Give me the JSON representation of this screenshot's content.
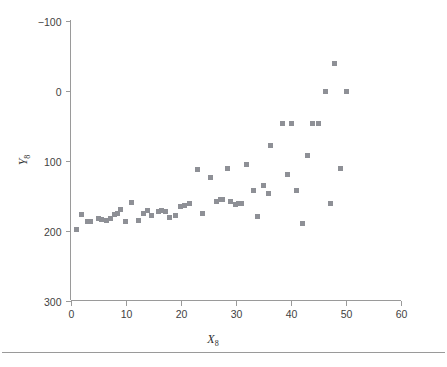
{
  "figure": {
    "background_color": "#ffffff",
    "axis_color": "#9a9a9a",
    "text_color": "#3f3f3f",
    "marker_color": "#8e9096",
    "footer_rule_color": "#9a9a9a"
  },
  "axes": {
    "x_title": "X",
    "x_subscript": "8",
    "y_title": "Y",
    "y_subscript": "8",
    "x_ticks": [
      "0",
      "10",
      "20",
      "30",
      "40",
      "50",
      "60"
    ],
    "y_ticks": [
      "300",
      "200",
      "100",
      "0",
      "−100"
    ]
  },
  "chart_data": {
    "type": "scatter",
    "title": "",
    "subtitle": "",
    "xlabel": "X8",
    "ylabel": "Y8",
    "xlim": [
      0,
      60
    ],
    "ylim": [
      -100,
      300
    ],
    "x_ticks": [
      0,
      10,
      20,
      30,
      40,
      50,
      60
    ],
    "y_ticks": [
      -100,
      0,
      100,
      200,
      300
    ],
    "grid": false,
    "legend": false,
    "marker": "square",
    "marker_color": "#8e9096",
    "marker_size_px": 5,
    "series": [
      {
        "name": "Y8 vs X8",
        "points": [
          [
            1,
            2
          ],
          [
            2,
            23
          ],
          [
            3,
            13
          ],
          [
            3.6,
            13
          ],
          [
            5,
            17
          ],
          [
            5.6,
            16
          ],
          [
            6.5,
            15
          ],
          [
            7.2,
            17
          ],
          [
            8,
            23
          ],
          [
            8.6,
            24
          ],
          [
            9,
            30
          ],
          [
            10,
            13
          ],
          [
            11,
            40
          ],
          [
            12.4,
            15
          ],
          [
            13.3,
            24
          ],
          [
            14,
            28
          ],
          [
            14.8,
            22
          ],
          [
            16,
            27
          ],
          [
            16.6,
            28
          ],
          [
            17.2,
            27
          ],
          [
            18,
            19
          ],
          [
            19,
            21
          ],
          [
            20,
            35
          ],
          [
            20.8,
            36
          ],
          [
            21.6,
            38
          ],
          [
            23,
            87
          ],
          [
            24,
            25
          ],
          [
            25.4,
            76
          ],
          [
            26.6,
            42
          ],
          [
            27.2,
            45
          ],
          [
            27.6,
            44
          ],
          [
            28.6,
            88
          ],
          [
            29,
            42
          ],
          [
            30,
            37
          ],
          [
            30.6,
            38
          ],
          [
            31,
            38
          ],
          [
            32,
            95
          ],
          [
            33.2,
            57
          ],
          [
            34,
            20
          ],
          [
            35,
            65
          ],
          [
            36,
            53
          ],
          [
            36.4,
            121
          ],
          [
            38.6,
            153
          ],
          [
            39.4,
            80
          ],
          [
            40.2,
            153
          ],
          [
            41,
            57
          ],
          [
            42.2,
            10
          ],
          [
            43,
            107
          ],
          [
            44,
            153
          ],
          [
            45,
            153
          ],
          [
            46.4,
            199
          ],
          [
            47.2,
            38
          ],
          [
            48,
            238
          ],
          [
            49,
            88
          ],
          [
            50.2,
            199
          ]
        ]
      }
    ]
  }
}
